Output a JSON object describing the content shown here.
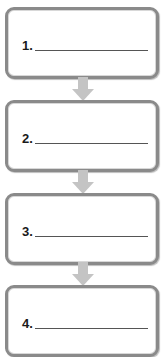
{
  "diagram": {
    "type": "vertical-flowchart",
    "steps": [
      {
        "label": "1.",
        "value": ""
      },
      {
        "label": "2.",
        "value": ""
      },
      {
        "label": "3.",
        "value": ""
      },
      {
        "label": "4.",
        "value": ""
      }
    ],
    "colors": {
      "box_border": "#8a8a8a",
      "arrow": "#c4c4c4",
      "text": "#1a1a1a"
    }
  }
}
